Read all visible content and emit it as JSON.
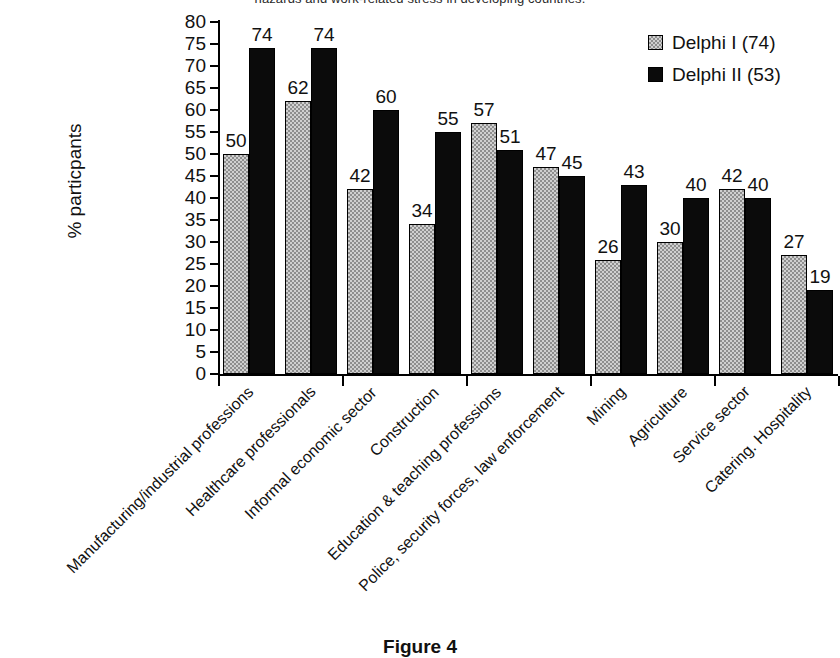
{
  "top_caption": "hazards and work-related stress in developing countries.",
  "figure_caption": "Figure 4",
  "legend": {
    "position": "top-right",
    "entries": [
      {
        "label": "Delphi I (74)",
        "color": "#d0d0d0",
        "swatch": "hatched-gray"
      },
      {
        "label": "Delphi II (53)",
        "color": "#0b0b0b",
        "swatch": "solid-black"
      }
    ]
  },
  "axes": {
    "ylabel": "% particpants",
    "xlabel": "",
    "ymin": 0,
    "ymax": 80,
    "ystep": 5,
    "yticks": [
      0,
      5,
      10,
      15,
      20,
      25,
      30,
      35,
      40,
      45,
      50,
      55,
      60,
      65,
      70,
      75,
      80
    ],
    "ytick_labels": [
      "0",
      "5",
      "10",
      "15",
      "20",
      "25",
      "30",
      "35",
      "40",
      "45",
      "50",
      "55",
      "60",
      "65",
      "70",
      "75",
      "80"
    ],
    "grid": false
  },
  "chart_data": {
    "type": "bar",
    "title": "",
    "subtitle": "",
    "xlabel": "",
    "ylabel": "% particpants",
    "ylim": [
      0,
      80
    ],
    "grid": false,
    "legend_position": "top-right",
    "categories": [
      "Manufacturing/industrial professions",
      "Healthcare professionals",
      "Informal economic sector",
      "Construction",
      "Education & teaching professions",
      "Police, security forces, law enforcement",
      "Mining",
      "Agriculture",
      "Service sector",
      "Catering. Hospitality"
    ],
    "series": [
      {
        "name": "Delphi I (74)",
        "color": "#d0d0d0",
        "values": [
          50,
          62,
          42,
          34,
          57,
          47,
          26,
          30,
          42,
          27
        ]
      },
      {
        "name": "Delphi II (53)",
        "color": "#0b0b0b",
        "values": [
          74,
          74,
          60,
          55,
          51,
          45,
          43,
          40,
          40,
          19
        ]
      }
    ]
  }
}
